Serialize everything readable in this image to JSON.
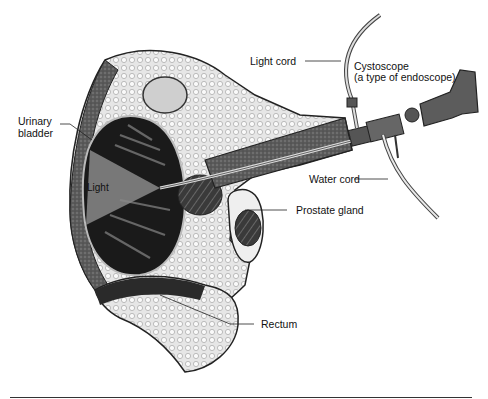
{
  "diagram": {
    "type": "anatomical-illustration",
    "labels": {
      "light_cord": "Light cord",
      "cystoscope_line1": "Cystoscope",
      "cystoscope_line2": "(a type of endoscope)",
      "urinary_bladder_line1": "Urinary",
      "urinary_bladder_line2": "bladder",
      "light": "Light",
      "water_cord": "Water cord",
      "prostate_gland": "Prostate gland",
      "rectum": "Rectum"
    },
    "colors": {
      "ink": "#111111",
      "dark_tissue": "#2a2a2a",
      "mid_tissue": "#6e6e6e",
      "light_tissue": "#d8d8d8",
      "background": "#ffffff"
    }
  }
}
